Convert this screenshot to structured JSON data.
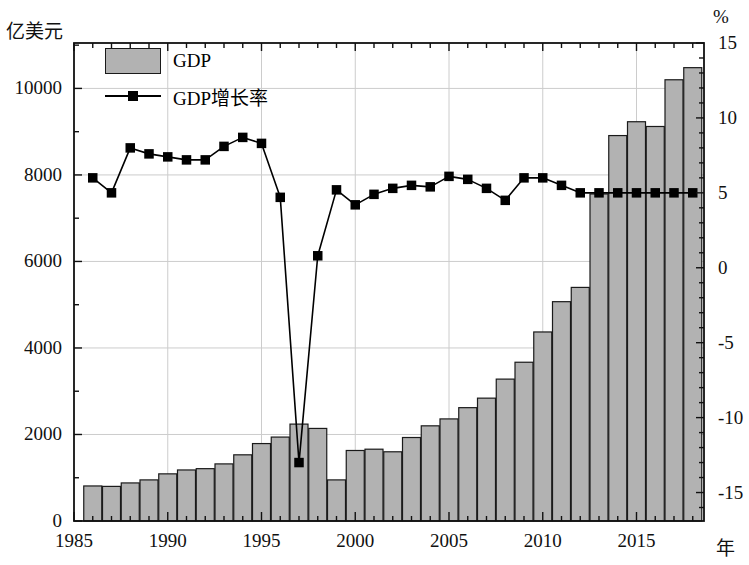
{
  "chart_data": {
    "type": "bar",
    "title": "",
    "xlabel": "年",
    "ylabel": "亿美元",
    "y2label": "%",
    "x": [
      1986,
      1987,
      1988,
      1989,
      1990,
      1991,
      1992,
      1993,
      1994,
      1995,
      1996,
      1997,
      1998,
      1999,
      2000,
      2001,
      2002,
      2003,
      2004,
      2005,
      2006,
      2007,
      2008,
      2009,
      2010,
      2011,
      2012,
      2013,
      2014,
      2015,
      2016,
      2017,
      2018
    ],
    "xlim": [
      1985,
      2018.6
    ],
    "xticks": [
      1985,
      1990,
      1995,
      2000,
      2005,
      2010,
      2015
    ],
    "xtick_labels": [
      "1985",
      "1990",
      "1995",
      "2000",
      "2005",
      "2010",
      "2015"
    ],
    "ylim": [
      0,
      11050
    ],
    "yticks": [
      0,
      2000,
      4000,
      6000,
      8000,
      10000
    ],
    "ytick_labels": [
      "0",
      "2000",
      "4000",
      "6000",
      "8000",
      "10000"
    ],
    "y_minor_step": 1000,
    "y2lim": [
      -16.9,
      15.0
    ],
    "y2ticks": [
      -15,
      -10,
      -5,
      0,
      5,
      10,
      15
    ],
    "y2tick_labels": [
      "-15",
      "-10",
      "-5",
      "0",
      "5",
      "10",
      "15"
    ],
    "y2_minor_step": 1,
    "grid": "horizontal-and-vertical-light",
    "legend_position": "upper-left-inside",
    "series": [
      {
        "name": "GDP",
        "unit": "亿美元",
        "render": "bar",
        "axis": "left",
        "fill_color": "#b2b2b2",
        "edge_color": "#1a1a1a",
        "values": [
          810,
          800,
          880,
          950,
          1090,
          1180,
          1210,
          1320,
          1530,
          1790,
          1940,
          2240,
          2140,
          950,
          1630,
          1660,
          1600,
          1930,
          2200,
          2360,
          2620,
          2840,
          3280,
          3670,
          4370,
          5070,
          5400,
          7560,
          8910,
          9230,
          9120,
          8650,
          9300
        ],
        "final_values_note": "last two bars 10200 and 10480"
      },
      {
        "name": "GDP增长率",
        "unit": "%",
        "render": "line-marker",
        "axis": "right",
        "line_color": "#000000",
        "marker": "square",
        "marker_color": "#000000",
        "values": [
          6.0,
          5.0,
          8.0,
          7.6,
          7.4,
          7.2,
          7.2,
          8.1,
          8.7,
          8.3,
          4.7,
          -13.0,
          0.8,
          5.2,
          4.2,
          4.9,
          5.3,
          5.5,
          5.4,
          6.1,
          5.9,
          5.3,
          4.5,
          6.0,
          6.0,
          5.5,
          5.0,
          5.0,
          5.0,
          5.0,
          5.0,
          5.0,
          5.0
        ]
      }
    ],
    "legend": [
      {
        "label": "GDP",
        "swatch": "bar"
      },
      {
        "label": "GDP增长率",
        "swatch": "line-marker"
      }
    ]
  },
  "plot": {
    "bar_fill": "#b2b2b2",
    "bar_edge": "#1a1a1a",
    "frame_color": "#111111",
    "grid_color": "#cccccc"
  }
}
